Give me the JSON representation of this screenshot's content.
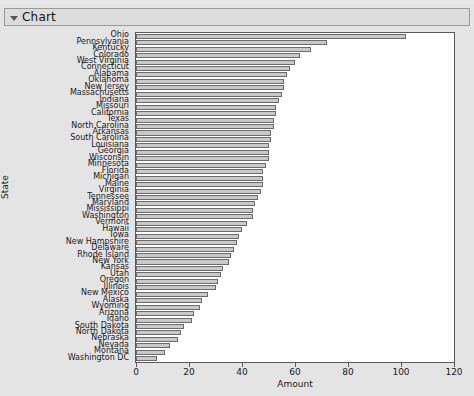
{
  "window": {
    "title": "Chart",
    "disclosure_icon": "triangle-down-icon"
  },
  "chart_data": {
    "type": "bar",
    "orientation": "horizontal",
    "title": "",
    "xlabel": "Amount",
    "ylabel": "State",
    "xlim": [
      0,
      120
    ],
    "ylim": null,
    "grid": false,
    "legend": null,
    "xticks": [
      0,
      20,
      40,
      60,
      80,
      100,
      120
    ],
    "xticklabels": [
      "0",
      "20",
      "40",
      "60",
      "80",
      "100",
      "120"
    ],
    "bar_fill_color": "#c9c9c9",
    "bar_edge_color": "#6b6b6b",
    "plot_background": "#ffffff",
    "panel_background": "#e4e4e4",
    "categories": [
      "Ohio",
      "Pennsylvania",
      "Kentucky",
      "Colorado",
      "West Virginia",
      "Connecticut",
      "Alabama",
      "Oklahoma",
      "New Jersey",
      "Massachusetts",
      "Indiana",
      "Missouri",
      "California",
      "Texas",
      "North Carolina",
      "Arkansas",
      "South Carolina",
      "Louisiana",
      "Georgia",
      "Wisconsin",
      "Minnesota",
      "Florida",
      "Michigan",
      "Maine",
      "Virginia",
      "Tennessee",
      "Maryland",
      "Mississippi",
      "Washington",
      "Vermont",
      "Hawaii",
      "Iowa",
      "New Hampshire",
      "Delaware",
      "Rhode Island",
      "New York",
      "Kansas",
      "Utah",
      "Oregon",
      "Illinois",
      "New Mexico",
      "Alaska",
      "Wyoming",
      "Arizona",
      "Idaho",
      "South Dakota",
      "North Dakota",
      "Nebraska",
      "Nevada",
      "Montana",
      "Washington DC"
    ],
    "values": [
      102,
      72,
      66,
      62,
      60,
      58,
      57,
      56,
      56,
      55,
      54,
      53,
      53,
      52,
      52,
      51,
      51,
      50,
      50,
      50,
      49,
      48,
      48,
      48,
      47,
      46,
      45,
      44,
      44,
      42,
      40,
      39,
      38,
      37,
      36,
      35,
      33,
      32,
      31,
      30,
      27,
      25,
      24,
      22,
      21,
      18,
      17,
      16,
      13,
      11,
      8
    ]
  }
}
